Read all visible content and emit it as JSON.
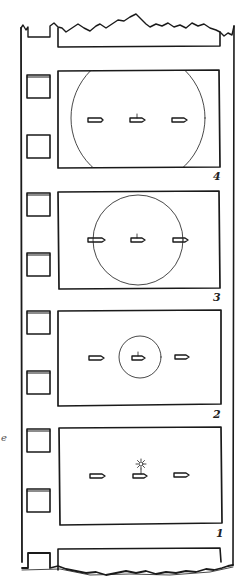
{
  "figure": {
    "type": "film-strip-illustration",
    "stroke_color": "#1a1a1a",
    "background": "#ffffff",
    "frames": [
      {
        "label": "4",
        "circle_radius": 68,
        "description": "large sphere, clipped by frame"
      },
      {
        "label": "3",
        "circle_radius": 45,
        "description": "medium sphere touching outer ships"
      },
      {
        "label": "2",
        "circle_radius": 21,
        "description": "small sphere around center ship"
      },
      {
        "label": "1",
        "circle_radius": 0,
        "description": "flash emitted from center ship"
      }
    ],
    "objects_per_frame": 3,
    "side_mark": "e"
  }
}
